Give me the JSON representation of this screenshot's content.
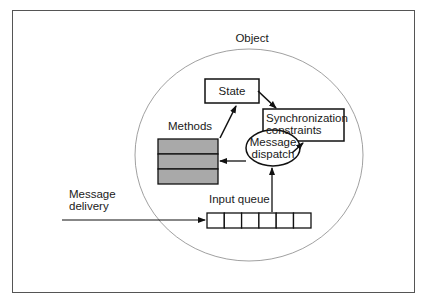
{
  "diagram": {
    "object_label": "Object",
    "state_label": "State",
    "sync_label_line1": "Synchronization",
    "sync_label_line2": "constraints",
    "methods_label": "Methods",
    "dispatch_label_line1": "Message",
    "dispatch_label_line2": "dispatch",
    "queue_label": "Input queue",
    "delivery_label_line1": "Message",
    "delivery_label_line2": "delivery",
    "queue_cells": 6,
    "method_rows": 3,
    "colors": {
      "stroke": "#111111",
      "circle": "#777777",
      "methods_fill": "#a9a9a9",
      "frame": "#555555"
    }
  }
}
